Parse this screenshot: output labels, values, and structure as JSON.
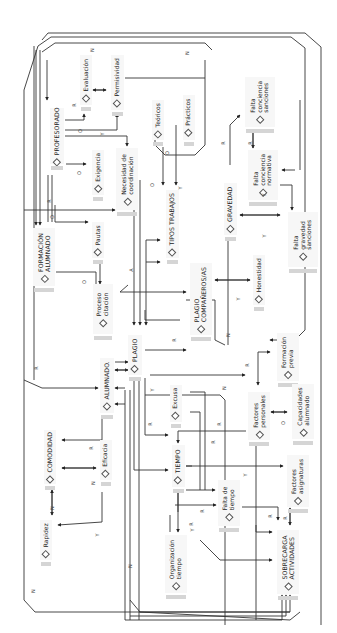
{
  "diagram": {
    "title": "",
    "orientation": "rotated-90-ccw",
    "nodes": [
      {
        "id": "profesorado",
        "label": "PROFESORADO",
        "caps": true,
        "x": 50,
        "y": 108,
        "w": 14,
        "h": 56
      },
      {
        "id": "evaluacion",
        "label": "Evaluación",
        "caps": false,
        "x": 80,
        "y": 55,
        "w": 12,
        "h": 50
      },
      {
        "id": "permisividad",
        "label": "Permisividad",
        "caps": false,
        "x": 111,
        "y": 55,
        "w": 13,
        "h": 55
      },
      {
        "id": "exigencia",
        "label": "Exigencia",
        "caps": false,
        "x": 92,
        "y": 150,
        "w": 12,
        "h": 45
      },
      {
        "id": "necesidad_coordinacion",
        "label": "Necesidad de\ncoordinación",
        "caps": false,
        "x": 116,
        "y": 148,
        "w": 22,
        "h": 62
      },
      {
        "id": "teoricos",
        "label": "Teóricos",
        "caps": false,
        "x": 152,
        "y": 100,
        "w": 12,
        "h": 40
      },
      {
        "id": "practicos",
        "label": "Prácticos",
        "caps": false,
        "x": 183,
        "y": 95,
        "w": 12,
        "h": 45
      },
      {
        "id": "tipos_trabajos",
        "label": "TIPOS TRABAJOS",
        "caps": true,
        "x": 166,
        "y": 190,
        "w": 13,
        "h": 68
      },
      {
        "id": "formacion_alumnado",
        "label": "FORMACIÓN\nALUMNADO",
        "caps": true,
        "x": 33,
        "y": 228,
        "w": 22,
        "h": 58
      },
      {
        "id": "pautas",
        "label": "Pautas",
        "caps": false,
        "x": 92,
        "y": 222,
        "w": 12,
        "h": 36
      },
      {
        "id": "proceso_citacion",
        "label": "Proceso\ncitación",
        "caps": false,
        "x": 93,
        "y": 284,
        "w": 20,
        "h": 50
      },
      {
        "id": "plagio_companeros",
        "label": "PLAGIO\nCOMPAÑEROS/AS",
        "caps": true,
        "x": 190,
        "y": 263,
        "w": 22,
        "h": 72
      },
      {
        "id": "honestidad",
        "label": "Honestidad",
        "caps": false,
        "x": 253,
        "y": 255,
        "w": 12,
        "h": 50
      },
      {
        "id": "plagio",
        "label": "PLAGIO",
        "caps": true,
        "x": 128,
        "y": 335,
        "w": 14,
        "h": 40
      },
      {
        "id": "alumnado",
        "label": "ALUMNADO.",
        "caps": true,
        "x": 100,
        "y": 358,
        "w": 14,
        "h": 55
      },
      {
        "id": "gravedad",
        "label": "GRAVEDAD",
        "caps": true,
        "x": 224,
        "y": 183,
        "w": 13,
        "h": 52
      },
      {
        "id": "falta_conciencia_sanciones",
        "label": "Falta\nconciencia\nsanciones",
        "caps": false,
        "x": 245,
        "y": 77,
        "w": 30,
        "h": 50
      },
      {
        "id": "falta_conciencia_normativa",
        "label": "Falta\nconciencia\nnormativa",
        "caps": false,
        "x": 248,
        "y": 150,
        "w": 30,
        "h": 50
      },
      {
        "id": "falta_gravedad_sanciones",
        "label": "Falta\ngravedad\nsanciones",
        "caps": false,
        "x": 288,
        "y": 212,
        "w": 30,
        "h": 55
      },
      {
        "id": "formacion_previa",
        "label": "Formación\nprevia",
        "caps": false,
        "x": 277,
        "y": 333,
        "w": 22,
        "h": 48
      },
      {
        "id": "factores_personales",
        "label": "Factores\npersonales",
        "caps": false,
        "x": 248,
        "y": 392,
        "w": 22,
        "h": 48
      },
      {
        "id": "capacidades_alumnado",
        "label": "Capacidades\nalumnado",
        "caps": false,
        "x": 292,
        "y": 384,
        "w": 22,
        "h": 55
      },
      {
        "id": "excusa",
        "label": "Excusa",
        "caps": false,
        "x": 170,
        "y": 385,
        "w": 12,
        "h": 37
      },
      {
        "id": "comodidad",
        "label": "COMODIDAD",
        "caps": true,
        "x": 44,
        "y": 430,
        "w": 12,
        "h": 54
      },
      {
        "id": "eficacia",
        "label": "Eficacia",
        "caps": false,
        "x": 100,
        "y": 440,
        "w": 12,
        "h": 40
      },
      {
        "id": "tiempo",
        "label": "TIEMPO",
        "caps": true,
        "x": 172,
        "y": 445,
        "w": 13,
        "h": 42
      },
      {
        "id": "falta_tiempo",
        "label": "Falta de\ntiempo",
        "caps": false,
        "x": 218,
        "y": 480,
        "w": 22,
        "h": 46
      },
      {
        "id": "factores_asignaturas",
        "label": "Factores\nasignaturas",
        "caps": false,
        "x": 287,
        "y": 455,
        "w": 22,
        "h": 52
      },
      {
        "id": "rapidez",
        "label": "Rapidez",
        "caps": false,
        "x": 40,
        "y": 520,
        "w": 12,
        "h": 40
      },
      {
        "id": "organizacion_tiempo",
        "label": "Organización\ntiempo",
        "caps": false,
        "x": 165,
        "y": 535,
        "w": 22,
        "h": 58
      },
      {
        "id": "sobrecarga_actividades",
        "label": "SOBRECARGA\nACTIVIDADES",
        "caps": true,
        "x": 277,
        "y": 530,
        "w": 22,
        "h": 64
      }
    ],
    "edge_labels": [
      {
        "text": "N",
        "x": 31,
        "y": 588
      },
      {
        "text": "R",
        "x": 72,
        "y": 102
      },
      {
        "text": "N",
        "x": 90,
        "y": 47
      },
      {
        "text": "O",
        "x": 78,
        "y": 128
      },
      {
        "text": "Y",
        "x": 100,
        "y": 131
      },
      {
        "text": "O",
        "x": 77,
        "y": 170
      },
      {
        "text": "R",
        "x": 47,
        "y": 198
      },
      {
        "text": "O",
        "x": 50,
        "y": 214
      },
      {
        "text": "O",
        "x": 82,
        "y": 279
      },
      {
        "text": "A",
        "x": 129,
        "y": 267
      },
      {
        "text": "O",
        "x": 165,
        "y": 150
      },
      {
        "text": "O",
        "x": 150,
        "y": 182
      },
      {
        "text": "Y",
        "x": 178,
        "y": 185
      },
      {
        "text": "N",
        "x": 185,
        "y": 50
      },
      {
        "text": "R",
        "x": 221,
        "y": 140
      },
      {
        "text": "R",
        "x": 248,
        "y": 140
      },
      {
        "text": "Y",
        "x": 262,
        "y": 192
      },
      {
        "text": "Y",
        "x": 262,
        "y": 233
      },
      {
        "text": "Y",
        "x": 236,
        "y": 296
      },
      {
        "text": "N",
        "x": 226,
        "y": 332
      },
      {
        "text": "R",
        "x": 172,
        "y": 337
      },
      {
        "text": "R",
        "x": 34,
        "y": 365
      },
      {
        "text": "Y",
        "x": 150,
        "y": 387
      },
      {
        "text": "R",
        "x": 148,
        "y": 421
      },
      {
        "text": "R",
        "x": 89,
        "y": 445
      },
      {
        "text": "N",
        "x": 91,
        "y": 480
      },
      {
        "text": "Y",
        "x": 95,
        "y": 532
      },
      {
        "text": "N",
        "x": 50,
        "y": 505
      },
      {
        "text": "R",
        "x": 245,
        "y": 362
      },
      {
        "text": "O",
        "x": 281,
        "y": 420
      },
      {
        "text": "N",
        "x": 222,
        "y": 385
      },
      {
        "text": "R",
        "x": 217,
        "y": 421
      },
      {
        "text": "R",
        "x": 211,
        "y": 439
      },
      {
        "text": "Y",
        "x": 243,
        "y": 472
      },
      {
        "text": "R",
        "x": 200,
        "y": 508
      },
      {
        "text": "R",
        "x": 189,
        "y": 521
      },
      {
        "text": "Y",
        "x": 190,
        "y": 527
      },
      {
        "text": "R",
        "x": 268,
        "y": 513
      },
      {
        "text": "R",
        "x": 283,
        "y": 515
      },
      {
        "text": "N",
        "x": 128,
        "y": 563
      }
    ]
  }
}
